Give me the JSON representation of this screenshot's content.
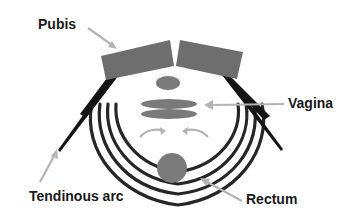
{
  "diagram": {
    "labels": {
      "pubis": "Pubis",
      "vagina": "Vagina",
      "tendinous_arc": "Tendinous arc",
      "rectum": "Rectum"
    },
    "colors": {
      "bone": "#6e6e6e",
      "organ": "#7a7a7a",
      "muscle": "#262626",
      "arrow": "#b4b4b4",
      "text": "#1a1a1a",
      "background": "#ffffff"
    }
  }
}
